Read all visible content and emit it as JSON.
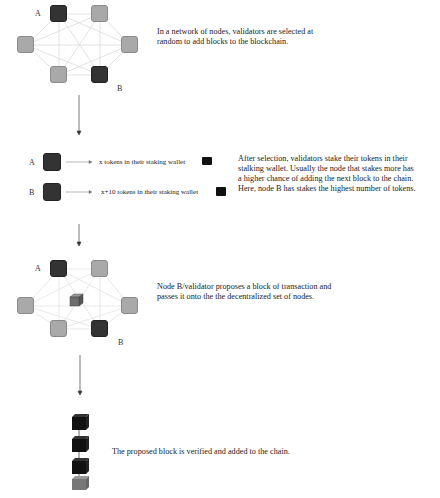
{
  "steps": [
    {
      "id": "network",
      "description": "In a network of nodes, validators are selected at random to add blocks to the blockchain.",
      "description_lines": [
        "In a network of nodes, validators are selected at",
        "random to add blocks to the blockchain."
      ],
      "labels": {
        "a": "A",
        "b": "B"
      }
    },
    {
      "id": "staking",
      "rows": [
        {
          "label": "A",
          "text": "x tokens in their staking wallet"
        },
        {
          "label": "B",
          "text": "x+10 tokens in their staking wallet"
        }
      ],
      "description_lines": [
        "After selection, validators stake their tokens in their",
        "stalking wallet. Usually the node that stakes more has",
        "a higher chance of adding the next block to the chain.",
        "Here, node B has stakes the highest number of tokens."
      ]
    },
    {
      "id": "propose",
      "labels": {
        "a": "A",
        "b": "B"
      },
      "description_lines": [
        "Node B/validator proposes a block of transaction and",
        "passes it onto the the decentralized set of nodes."
      ]
    },
    {
      "id": "chain",
      "description": "The proposed block is verified and added to the chain."
    }
  ],
  "colors": {
    "dark_node": "#333333",
    "light_node": "#a9a9a9",
    "edge": "#dddddd",
    "chain_block": "#111111",
    "proposed_block": "#777777"
  }
}
